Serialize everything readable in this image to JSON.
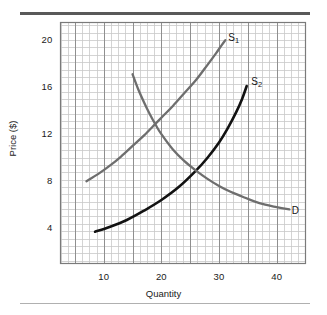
{
  "figure": {
    "background_color": "#ffffff",
    "rule_top_color": "#595959",
    "rule_bottom_color": "#b0b0b0"
  },
  "chart_data": {
    "type": "line",
    "title": "",
    "subtitle": "",
    "xlabel": "Quantity",
    "ylabel": "Price ($)",
    "xlim": [
      2.5,
      45
    ],
    "ylim": [
      1,
      21.5
    ],
    "xticks": [
      10,
      20,
      30,
      40
    ],
    "yticks": [
      4,
      8,
      12,
      16,
      20
    ],
    "xtick_labels": [
      "10",
      "20",
      "30",
      "40"
    ],
    "ytick_labels": [
      "4",
      "8",
      "12",
      "16",
      "20"
    ],
    "grid": true,
    "grid_minor_step_x": 1.25,
    "grid_minor_step_y": 0.625,
    "grid_major_step_x": 5,
    "grid_major_step_y": 2.5,
    "grid_minor_color": "#c9c9c9",
    "grid_major_color": "#8f8f8f",
    "legend_position": "inline-curve-labels",
    "annotations": [
      {
        "text": "S",
        "subscript": "1",
        "x": 31.6,
        "y": 20.2,
        "for_series": "S1"
      },
      {
        "text": "S",
        "subscript": "2",
        "x": 35.6,
        "y": 16.4,
        "for_series": "S2"
      },
      {
        "text": "D",
        "subscript": "",
        "x": 42.6,
        "y": 5.5,
        "for_series": "D"
      }
    ],
    "series": [
      {
        "name": "S1",
        "label": "S1",
        "display_label": "S₁",
        "kind": "supply",
        "color": "#6e6e6e",
        "width": 2.3,
        "points": [
          [
            7.0,
            8.0
          ],
          [
            9.0,
            8.6
          ],
          [
            11.0,
            9.3
          ],
          [
            13.0,
            10.1
          ],
          [
            15.0,
            11.0
          ],
          [
            17.0,
            11.9
          ],
          [
            19.0,
            12.9
          ],
          [
            20.2,
            13.5
          ],
          [
            22.0,
            14.4
          ],
          [
            24.0,
            15.5
          ],
          [
            26.0,
            16.6
          ],
          [
            28.0,
            17.9
          ],
          [
            29.5,
            18.9
          ],
          [
            30.5,
            19.6
          ],
          [
            31.1,
            20.0
          ]
        ]
      },
      {
        "name": "S2",
        "label": "S2",
        "display_label": "S₂",
        "kind": "supply",
        "color": "#121212",
        "width": 2.6,
        "points": [
          [
            8.5,
            3.7
          ],
          [
            11.0,
            4.1
          ],
          [
            14.0,
            4.7
          ],
          [
            17.0,
            5.5
          ],
          [
            20.0,
            6.4
          ],
          [
            23.0,
            7.5
          ],
          [
            26.0,
            8.9
          ],
          [
            28.0,
            10.0
          ],
          [
            30.0,
            11.3
          ],
          [
            31.5,
            12.5
          ],
          [
            33.0,
            13.9
          ],
          [
            34.0,
            15.0
          ],
          [
            34.8,
            16.1
          ]
        ]
      },
      {
        "name": "D",
        "label": "D",
        "display_label": "D",
        "kind": "demand",
        "color": "#6e6e6e",
        "width": 2.3,
        "points": [
          [
            15.0,
            17.1
          ],
          [
            16.0,
            15.8
          ],
          [
            17.0,
            14.7
          ],
          [
            18.0,
            13.7
          ],
          [
            19.0,
            12.8
          ],
          [
            20.0,
            12.0
          ],
          [
            22.0,
            10.7
          ],
          [
            24.0,
            9.7
          ],
          [
            26.0,
            8.9
          ],
          [
            28.0,
            8.2
          ],
          [
            30.0,
            7.6
          ],
          [
            32.0,
            7.1
          ],
          [
            34.0,
            6.7
          ],
          [
            36.0,
            6.3
          ],
          [
            38.0,
            6.0
          ],
          [
            40.0,
            5.8
          ],
          [
            42.2,
            5.6
          ]
        ]
      }
    ],
    "intersections": [
      {
        "series": [
          "S1",
          "D"
        ],
        "x": 20.2,
        "y": 12.0,
        "meaning": "equilibrium-1"
      },
      {
        "series": [
          "S2",
          "D"
        ],
        "x": 26.2,
        "y": 8.9,
        "meaning": "equilibrium-2"
      }
    ]
  }
}
